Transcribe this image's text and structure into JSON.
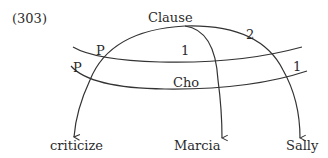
{
  "example_number": "(303)",
  "nodes": {
    "clause": "Clause",
    "cho": "Cho",
    "criticize": "criticize",
    "marcia": "Marcia",
    "sally": "Sally"
  },
  "arc_labels": {
    "p_upper": "P",
    "p_lower": "P",
    "one_upper": "1",
    "two": "2",
    "one_lower": "1"
  },
  "colors": {
    "line": "#333333",
    "text": "#2a2a2a"
  }
}
